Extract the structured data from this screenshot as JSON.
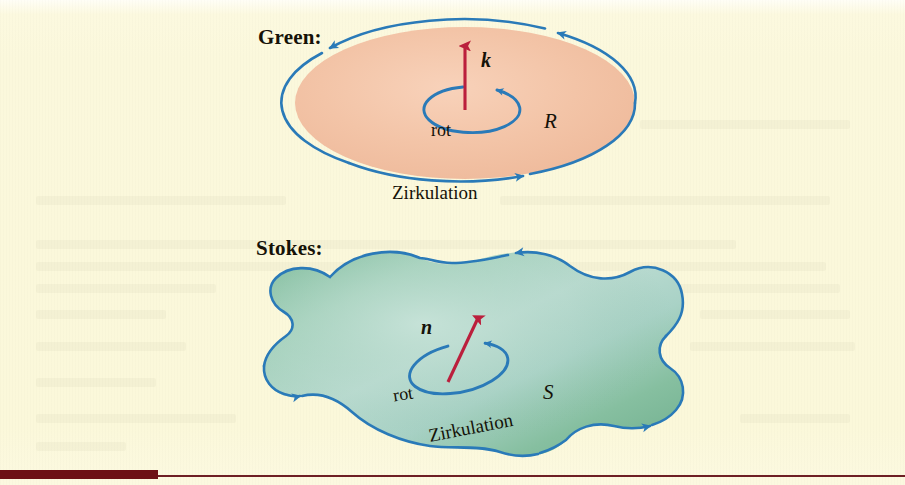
{
  "page": {
    "background_color": "#fbf8dc",
    "accent_rule_color": "#6d1115"
  },
  "figure": {
    "title_green": "Green:",
    "title_stokes": "Stokes:",
    "green_panel": {
      "label": "Green:",
      "region_label": "R",
      "normal_vector_label": "k",
      "rot_label": "rot",
      "circulation_label": "Zirkulation",
      "surface_fill_color": "#f3c3a6",
      "boundary_color": "#2a7ab8",
      "vector_color": "#bb1f3c",
      "shape": "ellipse"
    },
    "stokes_panel": {
      "label": "Stokes:",
      "region_label": "S",
      "normal_vector_label": "n",
      "rot_label": "rot",
      "circulation_label": "Zirkulation",
      "surface_fill_color": "#8fc4ad",
      "boundary_color": "#2a7ab8",
      "vector_color": "#bb1f3c",
      "shape": "blob"
    }
  }
}
